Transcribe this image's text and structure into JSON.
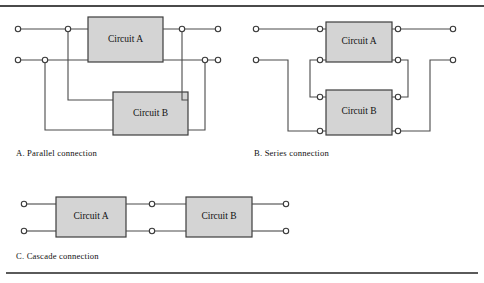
{
  "figure": {
    "panels": [
      {
        "id": "parallel",
        "caption": "A.  Parallel connection",
        "blocks": [
          {
            "name": "circuit-a",
            "label": "Circuit A"
          },
          {
            "name": "circuit-b",
            "label": "Circuit B"
          }
        ]
      },
      {
        "id": "series",
        "caption": "B.  Series connection",
        "blocks": [
          {
            "name": "circuit-a",
            "label": "Circuit A"
          },
          {
            "name": "circuit-b",
            "label": "Circuit B"
          }
        ]
      },
      {
        "id": "cascade",
        "caption": "C.  Cascade connection",
        "blocks": [
          {
            "name": "circuit-a",
            "label": "Circuit A"
          },
          {
            "name": "circuit-b",
            "label": "Circuit B"
          }
        ]
      }
    ],
    "colors": {
      "block_fill": "#d4d4d4",
      "line": "#4a4a4a",
      "terminal_fill": "#ffffff",
      "background": "#ffffff"
    }
  }
}
